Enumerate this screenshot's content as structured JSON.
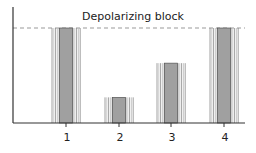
{
  "chart_data": {
    "type": "bar",
    "title": "Depolarizing block",
    "xlabel": "",
    "ylabel": "",
    "categories": [
      "1",
      "2",
      "3",
      "4"
    ],
    "values": [
      100,
      27,
      63,
      100
    ],
    "ylim": [
      0,
      100
    ],
    "reference_line": {
      "label": "Depolarizing block",
      "value": 100,
      "style": "dashed"
    },
    "grid": false,
    "legend": null
  },
  "colors": {
    "inner_bar": "#a0a0a0",
    "stripe": "#888888",
    "axis": "#333333",
    "dash": "#999999"
  }
}
